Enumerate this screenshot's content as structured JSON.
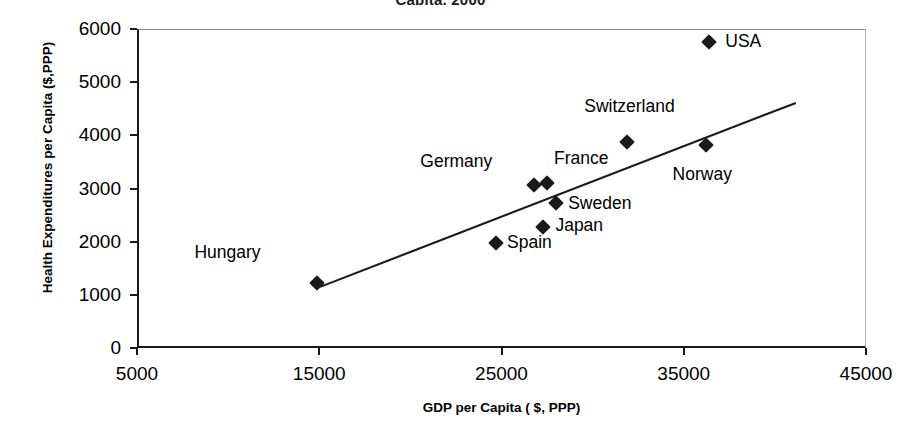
{
  "chart_data": {
    "type": "scatter",
    "title": "Capita, 2000",
    "xlabel": "GDP per Capita ( $, PPP)",
    "ylabel": "Health Expenditures per Capita ($,PPP)",
    "xlim": [
      5000,
      45000
    ],
    "ylim": [
      0,
      6000
    ],
    "xticks": [
      "5000",
      "15000",
      "25000",
      "35000",
      "45000"
    ],
    "yticks": [
      "0",
      "1000",
      "2000",
      "3000",
      "4000",
      "5000",
      "6000"
    ],
    "grid": false,
    "legend": "none",
    "marker_shape": "diamond",
    "marker_color": "#1a1a1a",
    "points": [
      {
        "label": "Hungary",
        "x": 14900,
        "y": 1230,
        "label_dx": -123,
        "label_dy": -31
      },
      {
        "label": "Spain",
        "x": 24700,
        "y": 1980,
        "label_dx": 11,
        "label_dy": -1
      },
      {
        "label": "Germany",
        "x": 26800,
        "y": 3070,
        "label_dx": -114,
        "label_dy": -24
      },
      {
        "label": "Japan",
        "x": 27300,
        "y": 2280,
        "label_dx": 12,
        "label_dy": -2
      },
      {
        "label": "France",
        "x": 27500,
        "y": 3110,
        "label_dx": 7,
        "label_dy": -25
      },
      {
        "label": "Sweden",
        "x": 28000,
        "y": 2730,
        "label_dx": 12,
        "label_dy": 0
      },
      {
        "label": "Switzerland",
        "x": 31900,
        "y": 3880,
        "label_dx": -43,
        "label_dy": -36
      },
      {
        "label": "Norway",
        "x": 36200,
        "y": 3820,
        "label_dx": -33,
        "label_dy": 29
      },
      {
        "label": "USA",
        "x": 36400,
        "y": 5750,
        "label_dx": 16,
        "label_dy": -1
      }
    ],
    "trendline": {
      "x_start": 15050,
      "y_start": 1150,
      "x_end": 41150,
      "y_end": 4610
    }
  }
}
